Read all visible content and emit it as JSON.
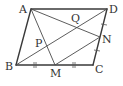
{
  "figure": {
    "type": "parallelogram-diagram",
    "stroke_color": "#3a3a3a",
    "background": "#ffffff",
    "points": {
      "A": {
        "label": "A",
        "x": 31,
        "y": 9,
        "label_x": 19,
        "label_y": 13
      },
      "D": {
        "label": "D",
        "x": 107,
        "y": 9,
        "label_x": 109,
        "label_y": 13
      },
      "B": {
        "label": "B",
        "x": 16,
        "y": 65,
        "label_x": 5,
        "label_y": 70
      },
      "C": {
        "label": "C",
        "x": 93,
        "y": 65,
        "label_x": 95,
        "label_y": 73
      },
      "M": {
        "label": "M",
        "x": 55,
        "y": 65,
        "label_x": 50,
        "label_y": 77
      },
      "N": {
        "label": "N",
        "x": 100,
        "y": 37,
        "label_x": 102,
        "label_y": 43
      },
      "P": {
        "label": "P",
        "x": 43,
        "y": 43,
        "label_x": 35,
        "label_y": 47
      },
      "Q": {
        "label": "Q",
        "x": 76,
        "y": 27,
        "label_x": 71,
        "label_y": 22
      }
    },
    "segments": [
      {
        "from": "A",
        "to": "D",
        "kind": "edge"
      },
      {
        "from": "D",
        "to": "C",
        "kind": "edge"
      },
      {
        "from": "C",
        "to": "B",
        "kind": "edge"
      },
      {
        "from": "B",
        "to": "A",
        "kind": "edge"
      },
      {
        "from": "B",
        "to": "D",
        "kind": "diagonal"
      },
      {
        "from": "A",
        "to": "M",
        "kind": "diagonal"
      },
      {
        "from": "A",
        "to": "N",
        "kind": "diagonal"
      },
      {
        "from": "M",
        "to": "N",
        "kind": "diagonal"
      }
    ],
    "equal_marks": [
      {
        "segment": "BM",
        "mark": "double-tick"
      },
      {
        "segment": "MC",
        "mark": "double-tick"
      },
      {
        "segment": "DN",
        "mark": "single-tick"
      },
      {
        "segment": "NC",
        "mark": "single-tick"
      }
    ]
  },
  "labels": {
    "A": "A",
    "B": "B",
    "C": "C",
    "D": "D",
    "M": "M",
    "N": "N",
    "P": "P",
    "Q": "Q"
  }
}
